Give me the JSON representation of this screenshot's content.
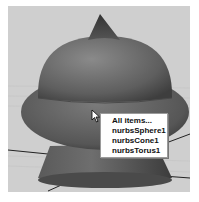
{
  "viewport": {
    "background_color": "#cfcfcf",
    "objects": [
      "nurbsSphere1",
      "nurbsCone1",
      "nurbsTorus1"
    ]
  },
  "context_menu": {
    "items": [
      {
        "label": "All items..."
      },
      {
        "label": "nurbsSphere1"
      },
      {
        "label": "nurbsCone1"
      },
      {
        "label": "nurbsTorus1"
      }
    ]
  },
  "cursor": {
    "icon": "arrow-cursor-icon"
  }
}
